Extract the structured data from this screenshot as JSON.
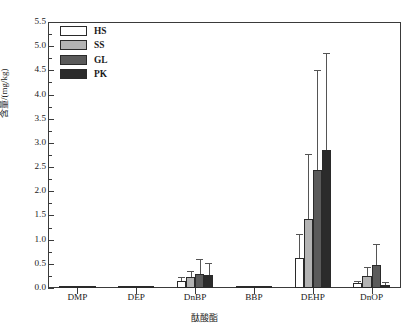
{
  "chart_data": {
    "type": "bar",
    "title": "",
    "xlabel": "酞酸酯",
    "ylabel": "含量/(mg/kg)",
    "ylim": [
      0.0,
      5.5
    ],
    "ytick_step": 0.5,
    "minor_ticks": true,
    "grid": false,
    "legend_position": "top-left",
    "categories": [
      "DMP",
      "DEP",
      "DnBP",
      "BBP",
      "DEHP",
      "DnOP"
    ],
    "ytick_labels": [
      "0.0",
      "0.5",
      "1.0",
      "1.5",
      "2.0",
      "2.5",
      "3.0",
      "3.5",
      "4.0",
      "4.5",
      "5.0",
      "5.5"
    ],
    "series": [
      {
        "name": "HS",
        "color": "#ffffff",
        "values": [
          0.03,
          0.04,
          0.14,
          0.05,
          0.63,
          0.1
        ],
        "errors": [
          0.01,
          0.01,
          0.09,
          0.01,
          0.48,
          0.05
        ]
      },
      {
        "name": "SS",
        "color": "#b3b3b3",
        "values": [
          0.02,
          0.03,
          0.22,
          0.03,
          1.43,
          0.25
        ],
        "errors": [
          0.01,
          0.01,
          0.14,
          0.01,
          1.35,
          0.18
        ]
      },
      {
        "name": "GL",
        "color": "#5a5a5a",
        "values": [
          0.04,
          0.04,
          0.28,
          0.04,
          2.45,
          0.47
        ],
        "errors": [
          0.01,
          0.01,
          0.31,
          0.01,
          2.05,
          0.43
        ]
      },
      {
        "name": "PK",
        "color": "#2b2b2b",
        "values": [
          0.03,
          0.04,
          0.26,
          0.04,
          2.85,
          0.06
        ],
        "errors": [
          0.01,
          0.01,
          0.26,
          0.01,
          2.0,
          0.06
        ]
      }
    ]
  },
  "legend": {
    "entries": [
      {
        "label": "HS",
        "color": "#ffffff"
      },
      {
        "label": "SS",
        "color": "#b3b3b3"
      },
      {
        "label": "GL",
        "color": "#5a5a5a"
      },
      {
        "label": "PK",
        "color": "#2b2b2b"
      }
    ]
  },
  "axes": {
    "y_label": "含量/(mg/kg)",
    "x_label": "酞酸酯"
  }
}
